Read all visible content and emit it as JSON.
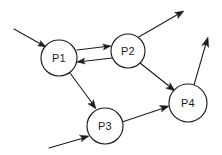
{
  "diagram": {
    "type": "directed-graph",
    "canvas": {
      "width": 222,
      "height": 155
    },
    "style": {
      "background_color": "#ffffff",
      "stroke_color": "#1c1c1c",
      "node_fill": "#ffffff",
      "rendering": "hand-drawn pencil sketch"
    },
    "nodes": [
      {
        "id": "P1",
        "label": "P1",
        "cx": 59,
        "cy": 58,
        "r": 18
      },
      {
        "id": "P2",
        "label": "P2",
        "cx": 128,
        "cy": 51,
        "r": 17
      },
      {
        "id": "P3",
        "label": "P3",
        "cx": 105,
        "cy": 126,
        "r": 18
      },
      {
        "id": "P4",
        "label": "P4",
        "cx": 188,
        "cy": 103,
        "r": 19
      }
    ],
    "edges": [
      {
        "id": "in-to-p1",
        "from": "external",
        "to": "P1",
        "label": "",
        "directed": true,
        "path": "M 14,29 L 46,47",
        "head": {
          "x": 46,
          "y": 47,
          "angle": 29
        }
      },
      {
        "id": "p1-to-p2",
        "from": "P1",
        "to": "P2",
        "label": "",
        "directed": true,
        "path": "M 77,50 L 110,46",
        "head": {
          "x": 111,
          "y": 46,
          "angle": -7
        }
      },
      {
        "id": "p2-to-p1",
        "from": "P2",
        "to": "P1",
        "label": "",
        "directed": true,
        "path": "M 112,58 L 78,62",
        "head": {
          "x": 77,
          "y": 62,
          "angle": 173
        }
      },
      {
        "id": "p2-to-out",
        "from": "P2",
        "to": "external",
        "label": "",
        "directed": true,
        "path": "M 137,38 L 182,12",
        "head": {
          "x": 184,
          "y": 11,
          "angle": -30
        }
      },
      {
        "id": "p2-to-p4",
        "from": "P2",
        "to": "P4",
        "label": "",
        "directed": true,
        "path": "M 140,63 L 174,90",
        "head": {
          "x": 175,
          "y": 91,
          "angle": 38
        }
      },
      {
        "id": "p1-to-p3",
        "from": "P1",
        "to": "P3",
        "label": "",
        "directed": true,
        "path": "M 70,73 L 95,107",
        "head": {
          "x": 96,
          "y": 109,
          "angle": 54
        }
      },
      {
        "id": "in-to-p3",
        "from": "external",
        "to": "P3",
        "label": "",
        "directed": true,
        "path": "M 49,148 L 87,137",
        "head": {
          "x": 89,
          "y": 136,
          "angle": -16
        }
      },
      {
        "id": "p3-to-p4",
        "from": "P3",
        "to": "P4",
        "label": "",
        "directed": true,
        "path": "M 122,122 L 167,107",
        "head": {
          "x": 169,
          "y": 106,
          "angle": -18
        }
      },
      {
        "id": "p4-to-out",
        "from": "P4",
        "to": "external",
        "label": "",
        "directed": true,
        "path": "M 194,85 L 207,40",
        "head": {
          "x": 208,
          "y": 37,
          "angle": -74
        }
      }
    ]
  }
}
